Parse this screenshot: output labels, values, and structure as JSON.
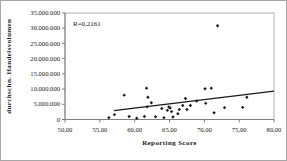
{
  "chart_data": {
    "type": "scatter",
    "title": "",
    "xlabel": "Reporting Score",
    "ylabel": "durchschn. Handelsvolumen",
    "annotation": "R=0,2161",
    "xlim": [
      50,
      80
    ],
    "ylim": [
      0,
      35000000
    ],
    "grid": false,
    "legend": "none",
    "x_ticks": [
      50,
      55,
      60,
      65,
      70,
      75,
      80
    ],
    "x_tick_labels": [
      "50,00",
      "55,00",
      "60,00",
      "65,00",
      "70,00",
      "75,00",
      "80,00"
    ],
    "y_ticks": [
      0,
      5000000,
      10000000,
      15000000,
      20000000,
      25000000,
      30000000,
      35000000
    ],
    "y_tick_labels": [
      "0",
      "5.000.000",
      "10.000.000",
      "15.000.000",
      "20.000.000",
      "25.000.000",
      "30.000.000",
      "35.000.000"
    ],
    "points": [
      [
        56.3,
        600000
      ],
      [
        57.1,
        1600000
      ],
      [
        58.5,
        8000000
      ],
      [
        59.2,
        1000000
      ],
      [
        60.3,
        400000
      ],
      [
        61.4,
        1000000
      ],
      [
        61.7,
        10300000
      ],
      [
        61.9,
        7300000
      ],
      [
        61.8,
        4200000
      ],
      [
        62.4,
        5500000
      ],
      [
        63.0,
        900000
      ],
      [
        63.9,
        3600000
      ],
      [
        64.2,
        600000
      ],
      [
        64.7,
        3000000
      ],
      [
        64.9,
        4100000
      ],
      [
        65.1,
        3800000
      ],
      [
        65.3,
        2600000
      ],
      [
        65.5,
        800000
      ],
      [
        66.2,
        1900000
      ],
      [
        66.4,
        3300000
      ],
      [
        66.9,
        4600000
      ],
      [
        67.3,
        6900000
      ],
      [
        67.5,
        3300000
      ],
      [
        68.0,
        4600000
      ],
      [
        68.9,
        6100000
      ],
      [
        70.1,
        10100000
      ],
      [
        70.2,
        5300000
      ],
      [
        71.0,
        10300000
      ],
      [
        71.4,
        2200000
      ],
      [
        71.9,
        30800000
      ],
      [
        72.9,
        3900000
      ],
      [
        75.5,
        4000000
      ],
      [
        76.1,
        7300000
      ]
    ],
    "trendline": {
      "x1": 57.0,
      "y1": 2900000,
      "x2": 80,
      "y2": 9300000
    },
    "colors": {
      "background": "#ffffff",
      "point": "#1a1a1a",
      "trend": "#1a1a1a",
      "plot_border": "#b0b0b0",
      "axis": "#808080",
      "text": "#1a1a1a",
      "outer_border": "#a6a6a6"
    }
  }
}
